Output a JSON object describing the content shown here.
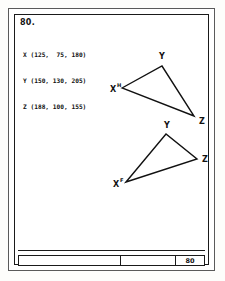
{
  "sheet": {
    "problem_number": "80.",
    "title_block_number": "80"
  },
  "coordinates": {
    "lines": [
      "X (125,  75, 180)",
      "Y (150, 130, 205)",
      "Z (188, 100, 155)"
    ],
    "points": [
      {
        "name": "X",
        "values": [
          125,
          75,
          180
        ]
      },
      {
        "name": "Y",
        "values": [
          150,
          130,
          205
        ]
      },
      {
        "name": "Z",
        "values": [
          188,
          100,
          155
        ]
      }
    ]
  },
  "figures": {
    "top_view": {
      "label": "upper-triangle",
      "vertices": [
        {
          "name": "X",
          "superscript": "H",
          "x": 108,
          "y": 74
        },
        {
          "name": "Y",
          "superscript": "",
          "x": 148,
          "y": 52
        },
        {
          "name": "Z",
          "superscript": "",
          "x": 180,
          "y": 102
        }
      ]
    },
    "front_view": {
      "label": "lower-triangle",
      "vertices": [
        {
          "name": "X",
          "superscript": "F",
          "x": 112,
          "y": 168
        },
        {
          "name": "Y",
          "superscript": "",
          "x": 152,
          "y": 120
        },
        {
          "name": "Z",
          "superscript": "",
          "x": 183,
          "y": 145
        }
      ]
    }
  },
  "colors": {
    "ink": "#111111",
    "paper": "#ffffff",
    "outer_frame": "#5a5a5a"
  }
}
